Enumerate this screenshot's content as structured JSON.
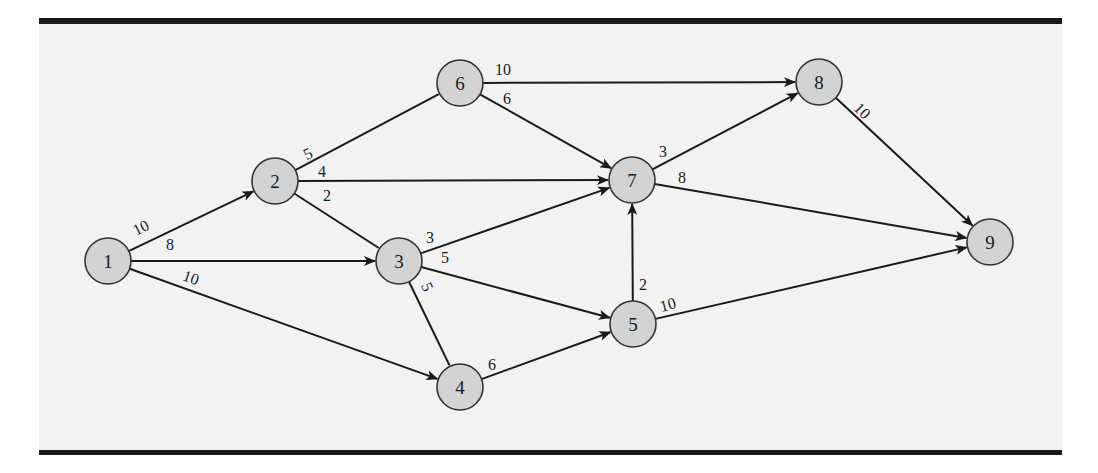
{
  "figure": {
    "panel_color": "#f2f2f2",
    "rule_color": "#1a1a1a",
    "node_fill": "#d3d3d3",
    "node_stroke": "#333333",
    "edge_color": "#1a1a1a"
  },
  "nodes": [
    {
      "id": "1",
      "label": "1",
      "x": 108,
      "y": 261
    },
    {
      "id": "2",
      "label": "2",
      "x": 275,
      "y": 181
    },
    {
      "id": "3",
      "label": "3",
      "x": 399,
      "y": 261
    },
    {
      "id": "4",
      "label": "4",
      "x": 460,
      "y": 387
    },
    {
      "id": "5",
      "label": "5",
      "x": 633,
      "y": 324
    },
    {
      "id": "6",
      "label": "6",
      "x": 460,
      "y": 83
    },
    {
      "id": "7",
      "label": "7",
      "x": 632,
      "y": 180
    },
    {
      "id": "8",
      "label": "8",
      "x": 819,
      "y": 82
    },
    {
      "id": "9",
      "label": "9",
      "x": 990,
      "y": 242
    }
  ],
  "edges": [
    {
      "from": "1",
      "to": "2",
      "weight": "10",
      "directed": true,
      "lx": 141,
      "ly": 233,
      "rot": -27
    },
    {
      "from": "1",
      "to": "3",
      "weight": "8",
      "directed": true,
      "lx": 170,
      "ly": 250,
      "rot": 0
    },
    {
      "from": "1",
      "to": "4",
      "weight": "10",
      "directed": true,
      "lx": 191,
      "ly": 283,
      "rot": 19
    },
    {
      "from": "2",
      "to": "6",
      "weight": "5",
      "directed": false,
      "lx": 308,
      "ly": 159,
      "rot": -27
    },
    {
      "from": "2",
      "to": "7",
      "weight": "4",
      "directed": true,
      "lx": 322,
      "ly": 177,
      "rot": 0
    },
    {
      "from": "2",
      "to": "3",
      "weight": "2",
      "directed": false,
      "lx": 327,
      "ly": 201,
      "rot": 0
    },
    {
      "from": "3",
      "to": "7",
      "weight": "3",
      "directed": true,
      "lx": 430,
      "ly": 243,
      "rot": 0
    },
    {
      "from": "3",
      "to": "5",
      "weight": "5",
      "directed": true,
      "lx": 445,
      "ly": 263,
      "rot": 0
    },
    {
      "from": "3",
      "to": "4",
      "weight": "5",
      "directed": false,
      "lx": 427,
      "ly": 292,
      "rot": 65
    },
    {
      "from": "4",
      "to": "5",
      "weight": "6",
      "directed": true,
      "lx": 492,
      "ly": 370,
      "rot": 0
    },
    {
      "from": "5",
      "to": "7",
      "weight": "2",
      "directed": true,
      "lx": 643,
      "ly": 290,
      "rot": 0
    },
    {
      "from": "5",
      "to": "9",
      "weight": "10",
      "directed": true,
      "lx": 668,
      "ly": 310,
      "rot": -15
    },
    {
      "from": "6",
      "to": "8",
      "weight": "10",
      "directed": true,
      "lx": 503,
      "ly": 75,
      "rot": 0
    },
    {
      "from": "6",
      "to": "7",
      "weight": "6",
      "directed": true,
      "lx": 507,
      "ly": 104,
      "rot": 0
    },
    {
      "from": "7",
      "to": "8",
      "weight": "3",
      "directed": true,
      "lx": 663,
      "ly": 157,
      "rot": 0
    },
    {
      "from": "7",
      "to": "9",
      "weight": "8",
      "directed": true,
      "lx": 682,
      "ly": 183,
      "rot": 0
    },
    {
      "from": "8",
      "to": "9",
      "weight": "10",
      "directed": true,
      "lx": 862,
      "ly": 116,
      "rot": 45
    }
  ]
}
